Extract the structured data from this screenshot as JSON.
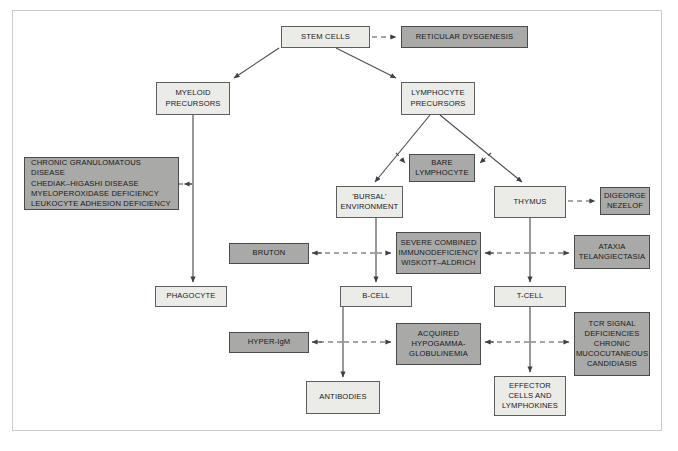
{
  "diagram": {
    "colors": {
      "light_fill": "#ebebe8",
      "shaded_fill": "#a9a9a7",
      "border": "#5d5f5d",
      "frame_border": "#c9cdc9",
      "background": "#ffffff",
      "edge": "#4b4d4f"
    },
    "nodes": [
      {
        "id": "stem_cells",
        "label": "STEM CELLS",
        "style": "light",
        "x": 281,
        "y": 26,
        "w": 89,
        "h": 22,
        "align": "center"
      },
      {
        "id": "reticular",
        "label": "RETICULAR DYSGENESIS",
        "style": "shaded",
        "x": 401,
        "y": 26,
        "w": 127,
        "h": 22,
        "align": "center"
      },
      {
        "id": "myeloid",
        "label": "MYELOID\nPRECURSORS",
        "style": "light",
        "x": 156,
        "y": 82,
        "w": 74,
        "h": 33,
        "align": "center"
      },
      {
        "id": "lymphocyte",
        "label": "LYMPHOCYTE\nPRECURSORS",
        "style": "light",
        "x": 401,
        "y": 82,
        "w": 74,
        "h": 33,
        "align": "center"
      },
      {
        "id": "phagocyte_group",
        "label": "CHRONIC GRANULOMATOUS DISEASE\nCHEDIAK–HIGASHI DISEASE\nMYELOPEROXIDASE DEFICIENCY\nLEUKOCYTE ADHESION DEFICIENCY",
        "style": "shaded",
        "x": 24,
        "y": 157,
        "w": 155,
        "h": 53,
        "align": "left"
      },
      {
        "id": "bare_lymphocyte",
        "label": "BARE\nLYMPHOCYTE",
        "style": "shaded",
        "x": 409,
        "y": 154,
        "w": 66,
        "h": 28,
        "align": "center"
      },
      {
        "id": "bursal",
        "label": "'BURSAL'\nENVIRONMENT",
        "style": "light",
        "x": 336,
        "y": 186,
        "w": 67,
        "h": 32,
        "align": "center"
      },
      {
        "id": "thymus",
        "label": "THYMUS",
        "style": "light",
        "x": 494,
        "y": 186,
        "w": 72,
        "h": 32,
        "align": "center"
      },
      {
        "id": "digeorge",
        "label": "DIGEORGE\nNEZELOF",
        "style": "shaded",
        "x": 600,
        "y": 187,
        "w": 50,
        "h": 28,
        "align": "center"
      },
      {
        "id": "bruton",
        "label": "BRUTON",
        "style": "shaded",
        "x": 229,
        "y": 243,
        "w": 80,
        "h": 21,
        "align": "center"
      },
      {
        "id": "scid",
        "label": "SEVERE COMBINED\nIMMUNODEFICIENCY\nWISKOTT–ALDRICH",
        "style": "shaded",
        "x": 396,
        "y": 232,
        "w": 85,
        "h": 42,
        "align": "center"
      },
      {
        "id": "ataxia",
        "label": "ATAXIA\nTELANGIECTASIA",
        "style": "shaded",
        "x": 574,
        "y": 235,
        "w": 76,
        "h": 34,
        "align": "center"
      },
      {
        "id": "phagocyte",
        "label": "PHAGOCYTE",
        "style": "light",
        "x": 155,
        "y": 286,
        "w": 72,
        "h": 21,
        "align": "center"
      },
      {
        "id": "b_cell",
        "label": "B-CELL",
        "style": "light",
        "x": 340,
        "y": 286,
        "w": 72,
        "h": 21,
        "align": "center"
      },
      {
        "id": "t_cell",
        "label": "T-CELL",
        "style": "light",
        "x": 494,
        "y": 286,
        "w": 72,
        "h": 21,
        "align": "center"
      },
      {
        "id": "hyper_igm",
        "label": "HYPER-IgM",
        "style": "shaded",
        "x": 229,
        "y": 332,
        "w": 80,
        "h": 21,
        "align": "center"
      },
      {
        "id": "hypogamma",
        "label": "ACQUIRED\nHYPOGAMMA-\nGLOBULINEMIA",
        "style": "shaded",
        "x": 396,
        "y": 323,
        "w": 85,
        "h": 42,
        "align": "center"
      },
      {
        "id": "tcr_signal",
        "label": "TCR SIGNAL\nDEFICIENCIES\nCHRONIC\nMUCOCUTANEOUS\nCANDIDIASIS",
        "style": "shaded",
        "x": 574,
        "y": 312,
        "w": 76,
        "h": 64,
        "align": "center"
      },
      {
        "id": "antibodies",
        "label": "ANTIBODIES",
        "style": "light",
        "x": 306,
        "y": 381,
        "w": 74,
        "h": 33,
        "align": "center"
      },
      {
        "id": "effector",
        "label": "EFFECTOR\nCELLS AND\nLYMPHOKINES",
        "style": "light",
        "x": 494,
        "y": 376,
        "w": 72,
        "h": 40,
        "align": "center"
      }
    ],
    "edges": [
      {
        "from": "stem_cells",
        "to": "reticular",
        "kind": "dashed"
      },
      {
        "from": "stem_cells",
        "to": "myeloid",
        "kind": "solid"
      },
      {
        "from": "stem_cells",
        "to": "lymphocyte",
        "kind": "solid"
      },
      {
        "from": "myeloid",
        "to": "phagocyte_group",
        "kind": "dashed"
      },
      {
        "from": "myeloid",
        "to": "phagocyte",
        "kind": "solid"
      },
      {
        "from": "lymphocyte",
        "to": "bursal",
        "kind": "solid"
      },
      {
        "from": "lymphocyte",
        "to": "thymus",
        "kind": "solid"
      },
      {
        "from": "lymphocyte",
        "to": "bare_lymphocyte",
        "kind": "dashed"
      },
      {
        "from": "thymus",
        "to": "digeorge",
        "kind": "dashed"
      },
      {
        "from": "bursal",
        "to": "b_cell",
        "kind": "solid"
      },
      {
        "from": "thymus",
        "to": "t_cell",
        "kind": "solid"
      },
      {
        "from": "bursal",
        "to": "bruton",
        "kind": "dashed"
      },
      {
        "from": "bursal",
        "to": "scid",
        "kind": "dashed"
      },
      {
        "from": "thymus",
        "to": "scid",
        "kind": "dashed"
      },
      {
        "from": "thymus",
        "to": "ataxia",
        "kind": "dashed"
      },
      {
        "from": "b_cell",
        "to": "antibodies",
        "kind": "solid"
      },
      {
        "from": "t_cell",
        "to": "effector",
        "kind": "solid"
      },
      {
        "from": "b_cell",
        "to": "hyper_igm",
        "kind": "dashed"
      },
      {
        "from": "b_cell",
        "to": "hypogamma",
        "kind": "dashed"
      },
      {
        "from": "t_cell",
        "to": "hypogamma",
        "kind": "dashed"
      },
      {
        "from": "t_cell",
        "to": "tcr_signal",
        "kind": "dashed"
      }
    ]
  }
}
